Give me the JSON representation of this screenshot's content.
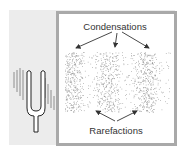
{
  "diagram": {
    "labels": {
      "condensations": "Condensations",
      "rarefactions": "Rarefactions"
    },
    "icons": [
      "tuning-fork-icon"
    ],
    "regions": {
      "condensation_band_count": 3,
      "rarefaction_gap_count": 2
    },
    "colors": {
      "background": "#ececec",
      "panel": "#ffffff",
      "border": "#a9a9a9",
      "dots": "#8a8a8a",
      "text": "#333333"
    }
  }
}
